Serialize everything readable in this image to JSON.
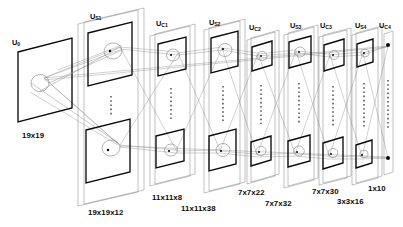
{
  "figure": {
    "kind": "neural-network-architecture-diagram",
    "background_color": "#ffffff",
    "ink_color": "#0b0b0b",
    "thin_line_color": "#8d8d8d"
  },
  "layer_labels": [
    {
      "id": "u0",
      "base": "U",
      "sub": "0",
      "text": "U0",
      "x": 12,
      "y": 39
    },
    {
      "id": "us1",
      "base": "U",
      "sub": "S1",
      "text": "US1",
      "x": 90,
      "y": 13
    },
    {
      "id": "uc1",
      "base": "U",
      "sub": "C1",
      "text": "UC1",
      "x": 156,
      "y": 20
    },
    {
      "id": "us2",
      "base": "U",
      "sub": "S2",
      "text": "US2",
      "x": 209,
      "y": 19
    },
    {
      "id": "uc2",
      "base": "U",
      "sub": "C2",
      "text": "UC2",
      "x": 249,
      "y": 24
    },
    {
      "id": "us3",
      "base": "U",
      "sub": "S3",
      "text": "US3",
      "x": 290,
      "y": 22
    },
    {
      "id": "uc3",
      "base": "U",
      "sub": "C3",
      "text": "UC3",
      "x": 320,
      "y": 22
    },
    {
      "id": "us4",
      "base": "U",
      "sub": "S4",
      "text": "US4",
      "x": 355,
      "y": 22
    },
    {
      "id": "uc4",
      "base": "U",
      "sub": "C4",
      "text": "UC4",
      "x": 379,
      "y": 22
    }
  ],
  "dimension_labels": [
    {
      "id": "dim-u0",
      "text": "19x19",
      "x": 22,
      "y": 132
    },
    {
      "id": "dim-us1",
      "text": "19x19x12",
      "x": 88,
      "y": 209
    },
    {
      "id": "dim-uc1",
      "text": "11x11x8",
      "x": 152,
      "y": 194
    },
    {
      "id": "dim-us2",
      "text": "11x11x38",
      "x": 181,
      "y": 205
    },
    {
      "id": "dim-uc2",
      "text": "7x7x22",
      "x": 238,
      "y": 189
    },
    {
      "id": "dim-us3",
      "text": "7x7x32",
      "x": 265,
      "y": 200
    },
    {
      "id": "dim-uc3",
      "text": "7x7x30",
      "x": 312,
      "y": 188
    },
    {
      "id": "dim-us4",
      "text": "3x3x16",
      "x": 337,
      "y": 198
    },
    {
      "id": "dim-uc4",
      "text": "1x10",
      "x": 368,
      "y": 185
    }
  ],
  "stages": [
    {
      "id": "u0",
      "dim": "19x19",
      "outer": false,
      "planes": 1
    },
    {
      "id": "us1",
      "dim": "19x19x12",
      "outer": true,
      "planes": 2
    },
    {
      "id": "uc1",
      "dim": "11x11x8",
      "outer": true,
      "planes": 2
    },
    {
      "id": "us2",
      "dim": "11x11x38",
      "outer": true,
      "planes": 2
    },
    {
      "id": "uc2",
      "dim": "7x7x22",
      "outer": true,
      "planes": 2
    },
    {
      "id": "us3",
      "dim": "7x7x32",
      "outer": true,
      "planes": 2
    },
    {
      "id": "uc3",
      "dim": "7x7x30",
      "outer": true,
      "planes": 2
    },
    {
      "id": "us4",
      "dim": "3x3x16",
      "outer": true,
      "planes": 2
    },
    {
      "id": "uc4",
      "dim": "1x10",
      "outer": true,
      "planes": 2
    }
  ]
}
